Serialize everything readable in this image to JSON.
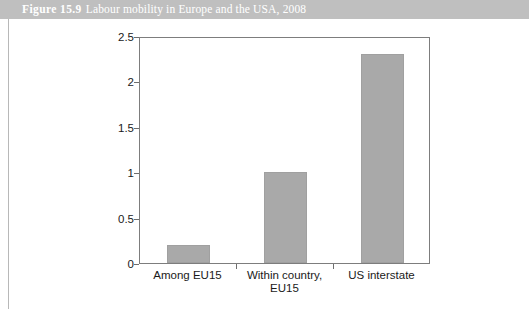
{
  "header": {
    "figure_number": "Figure 15.9",
    "caption": "Labour mobility in Europe and the USA, 2008"
  },
  "colors": {
    "header_band": "#bfbfbf",
    "header_text": "#ffffff",
    "bar_fill": "#a9a9a9",
    "axis_line": "#7d7d7d",
    "tick_text": "#1a1a1a",
    "page_background": "#ffffff"
  },
  "chart_data": {
    "type": "bar",
    "title": "Labour mobility in Europe and the USA, 2008",
    "categories": [
      "Among EU15",
      "Within country, EU15",
      "US interstate"
    ],
    "category_lines": [
      [
        "Among EU15"
      ],
      [
        "Within country,",
        "EU15"
      ],
      [
        "US interstate"
      ]
    ],
    "values": [
      0.2,
      1.0,
      2.3
    ],
    "xlabel": "",
    "ylabel": "",
    "ylim": [
      0,
      2.5
    ],
    "yticks": [
      0,
      0.5,
      1,
      1.5,
      2,
      2.5
    ],
    "ytick_labels": [
      "0",
      "0.5",
      "1",
      "1.5",
      "2",
      "2.5"
    ],
    "grid": false,
    "legend": false
  }
}
